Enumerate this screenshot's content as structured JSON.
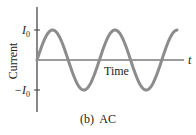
{
  "figure": {
    "caption": "(b)  AC",
    "y_axis_label": "Current",
    "x_axis_inline_label": "Time",
    "x_axis_end_label": "t",
    "y_tick_pos_label": "I",
    "y_tick_pos_sub": "0",
    "y_tick_neg_label": "−I",
    "y_tick_neg_sub": "0",
    "colors": {
      "axis": "#3a3a3a",
      "curve": "#8c8c8c",
      "text": "#222222"
    }
  },
  "chart_data": {
    "type": "line",
    "title": "(b) AC",
    "xlabel": "Time",
    "ylabel": "Current",
    "x_end_symbol": "t",
    "y_ticks": [
      "-I0",
      "I0"
    ],
    "series": [
      {
        "name": "Alternating current",
        "function": "I(t) = I0 * sin(2*pi*t/T)",
        "amplitude": "I0",
        "cycles_shown": 2.25,
        "x": [
          0,
          0.25,
          0.5,
          0.75,
          1.0,
          1.25,
          1.5,
          1.75,
          2.0,
          2.25
        ],
        "values": [
          0,
          1,
          0,
          -1,
          0,
          1,
          0,
          -1,
          0,
          1
        ]
      }
    ],
    "grid": false,
    "legend": "none"
  }
}
